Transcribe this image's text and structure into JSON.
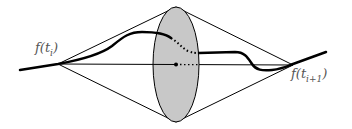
{
  "diagram": {
    "labels": {
      "left_point": {
        "func": "f(t",
        "sub": "i",
        "close": ")"
      },
      "right_point": {
        "func": "f(t",
        "sub": "i+1",
        "close": ")"
      }
    },
    "colors": {
      "ellipse_fill": "#c8c8c8",
      "stroke": "#000000",
      "label": "#555555"
    }
  }
}
